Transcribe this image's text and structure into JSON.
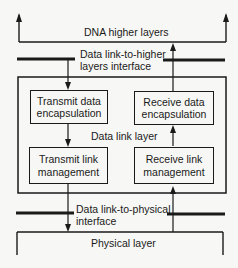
{
  "diagram": {
    "higher_layer": {
      "label": "DNA higher layers"
    },
    "upper_interface": {
      "line1": "Data link-to-higher",
      "line2": "layers interface"
    },
    "data_link_layer": {
      "label": "Data link layer",
      "blocks": {
        "transmit_data": {
          "line1": "Transmit data",
          "line2": "encapsulation"
        },
        "receive_data": {
          "line1": "Receive data",
          "line2": "encapsulation"
        },
        "transmit_link": {
          "line1": "Transmit link",
          "line2": "management"
        },
        "receive_link": {
          "line1": "Receive link",
          "line2": "management"
        }
      }
    },
    "lower_interface": {
      "line1": "Data link-to-physical",
      "line2": "interface"
    },
    "physical_layer": {
      "label": "Physical layer"
    },
    "flows": [
      {
        "from": "DNA higher layers",
        "to": "Transmit data encapsulation",
        "direction": "down"
      },
      {
        "from": "Transmit data encapsulation",
        "to": "Transmit link management",
        "direction": "down"
      },
      {
        "from": "Transmit link management",
        "to": "Physical layer",
        "direction": "down"
      },
      {
        "from": "Physical layer",
        "to": "Receive link management",
        "direction": "up"
      },
      {
        "from": "Receive link management",
        "to": "Receive data encapsulation",
        "direction": "up"
      },
      {
        "from": "Receive data encapsulation",
        "to": "DNA higher layers",
        "direction": "up"
      }
    ]
  }
}
